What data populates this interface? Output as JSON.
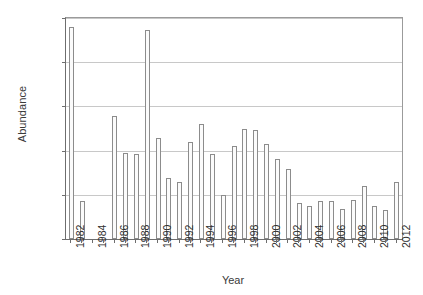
{
  "chart_data": {
    "type": "bar",
    "title": "",
    "subtitle": "",
    "xlabel": "Year",
    "ylabel": "Abundance",
    "xlim": [
      1981.5,
      2012.5
    ],
    "ylim": [
      0,
      100000
    ],
    "grid": true,
    "legend": null,
    "y_ticks": [
      0,
      20000,
      40000,
      60000,
      80000,
      100000
    ],
    "y_tick_labels": [
      "0",
      "20 000",
      "40 000",
      "60 000",
      "80 000",
      "100 000"
    ],
    "x_tick_labels": [
      "1982",
      "1984",
      "1986",
      "1988",
      "1990",
      "1992",
      "1994",
      "1996",
      "1998",
      "2000",
      "2002",
      "2004",
      "2006",
      "2008",
      "2010",
      "2012"
    ],
    "x_tick_label_step": 2,
    "categories": [
      1982,
      1983,
      1984,
      1985,
      1986,
      1987,
      1988,
      1989,
      1990,
      1991,
      1992,
      1993,
      1994,
      1995,
      1996,
      1997,
      1998,
      1999,
      2000,
      2001,
      2002,
      2003,
      2004,
      2005,
      2006,
      2007,
      2008,
      2009,
      2010,
      2011,
      2012
    ],
    "values": [
      95800,
      17200,
      null,
      null,
      55500,
      38800,
      38300,
      94700,
      45600,
      27400,
      25800,
      44000,
      52100,
      38400,
      19800,
      42000,
      49600,
      49300,
      43200,
      36400,
      31600,
      16400,
      14800,
      17400,
      17200,
      13700,
      17600,
      24000,
      14900,
      13200,
      25600
    ],
    "bar_fill": "#fbfbfb",
    "bar_edge": "#8c8c8c",
    "grid_color": "#c8c8c8",
    "axis_color": "#6e6e6e",
    "text_color": "#2f2f2f",
    "background": "#ffffff"
  }
}
